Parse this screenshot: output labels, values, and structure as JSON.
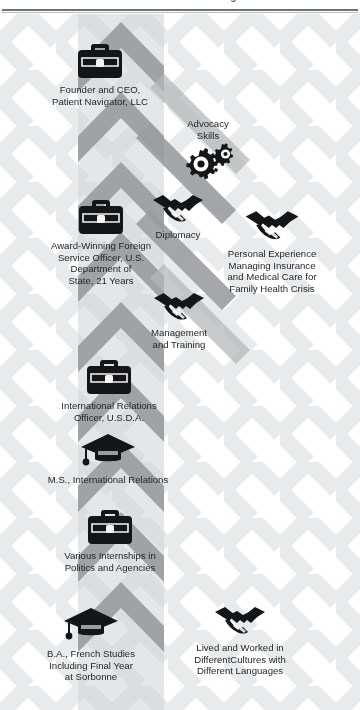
{
  "header": {
    "title": "Career Path: Patient Navigator",
    "rule_color": "#6e7378"
  },
  "theme": {
    "background": "#ffffff",
    "lattice_light": "#eceded",
    "lattice_mid": "#d8dadb",
    "spine_gray": "#9b9ea1",
    "spine_gray_dark": "#8a8d90",
    "icon_black": "#141517",
    "text_color": "#1f2124"
  },
  "diagram": {
    "type": "vertical-timeline-infographic",
    "spine_label": "upward chevron arrow column",
    "nodes": [
      {
        "id": "ceo",
        "icon": "briefcase-icon",
        "caption": "Founder and CEO,\nPatient Navigator, LLC",
        "column": "center"
      },
      {
        "id": "advocacy",
        "icon": "gears-icon",
        "caption": "Advocacy\nSkills",
        "column": "right",
        "label_position": "above"
      },
      {
        "id": "diplomacy",
        "icon": "handshake-icon",
        "caption": "Diplomacy",
        "column": "center-right"
      },
      {
        "id": "fso",
        "icon": "briefcase-icon",
        "caption": "Award-Winning Foreign\nService Officer, U.S.\nDepartment of\nState, 21 Years",
        "column": "center"
      },
      {
        "id": "personal",
        "icon": "handshake-icon",
        "caption": "Personal Experience\nManaging Insurance\nand Medical Care for\nFamily Health Crisis",
        "column": "right"
      },
      {
        "id": "management",
        "icon": "handshake-icon",
        "caption": "Management\nand Training",
        "column": "center-right"
      },
      {
        "id": "usda",
        "icon": "briefcase-icon",
        "caption": "International Relations\nOfficer, U.S.D.A.",
        "column": "center"
      },
      {
        "id": "ms",
        "icon": "graduation-cap-icon",
        "caption": "M.S., International Relations",
        "column": "center"
      },
      {
        "id": "internships",
        "icon": "briefcase-icon",
        "caption": "Various Internships in\nPolitics and Agencies",
        "column": "center"
      },
      {
        "id": "ba",
        "icon": "graduation-cap-icon",
        "caption": "B.A., French Studies\nIncluding Final Year\nat Sorbonne",
        "column": "center-left"
      },
      {
        "id": "lived",
        "icon": "handshake-icon",
        "caption": "Lived and Worked in\nDifferentCultures with\nDifferent Languages",
        "column": "right"
      }
    ]
  }
}
